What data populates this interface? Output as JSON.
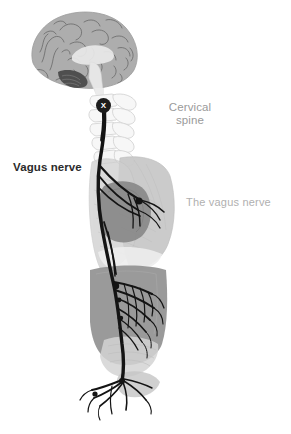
{
  "figure": {
    "name": "vagus-nerve-anatomy-illustration",
    "background_color": "#ffffff",
    "width": 291,
    "height": 434
  },
  "labels": {
    "vagus_nerve": "Vagus nerve",
    "cervical_spine": "Cervical\nspine",
    "the_vagus_nerve": "The vagus nerve",
    "marker_x": "X"
  },
  "colors": {
    "background": "#ffffff",
    "nerve_black": "#141414",
    "marker_badge": "#1c1c1c",
    "marker_glyph": "#ffffff",
    "label_bold_text": "#2b2b2b",
    "label_gray_text": "#9a9a9a",
    "label_light_text": "#b0b0b0",
    "brain_cortex": "#adadad",
    "brain_sulci": "#6e6e6e",
    "brainstem": "#e3e3e3",
    "cerebellum": "#4a4a4a",
    "vertebra_outline": "#cccccc",
    "vertebra_fill": "#f4f4f4",
    "lung": "#c8c8c8",
    "heart": "#8a8a8a",
    "abdomen": "#8f8f8f",
    "pelvis": "#b8b8b8"
  },
  "anatomy_parts": [
    {
      "id": "brain",
      "label": "Brain (sagittal cross-section)"
    },
    {
      "id": "brainstem",
      "label": "Brainstem"
    },
    {
      "id": "cerebellum",
      "label": "Cerebellum"
    },
    {
      "id": "cervical-vertebrae",
      "label": "Cervical vertebrae"
    },
    {
      "id": "vagus-nerve-trunk",
      "label": "Vagus nerve trunk"
    },
    {
      "id": "lungs",
      "label": "Lungs"
    },
    {
      "id": "heart",
      "label": "Heart"
    },
    {
      "id": "cardiac-plexus",
      "label": "Cardiac nerve plexus"
    },
    {
      "id": "abdomen",
      "label": "Abdominal viscera"
    },
    {
      "id": "abdominal-plexus",
      "label": "Abdominal nerve plexus"
    },
    {
      "id": "pelvic-branches",
      "label": "Terminal pelvic nerve branches"
    }
  ]
}
